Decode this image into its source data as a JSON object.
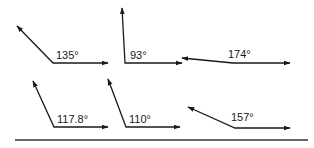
{
  "diagram": {
    "type": "angle-set",
    "colors": {
      "stroke": "#1a1a1a",
      "baseline": "#333333",
      "background": "#ffffff"
    },
    "angles": [
      {
        "label": "135°",
        "vertex": [
          53,
          63
        ],
        "ray1_end": [
          108,
          63
        ],
        "ray2_end": [
          17,
          26
        ],
        "label_pos": [
          56,
          59
        ]
      },
      {
        "label": "93°",
        "vertex": [
          125,
          63
        ],
        "ray1_end": [
          182,
          63
        ],
        "ray2_end": [
          122,
          8
        ],
        "label_pos": [
          130,
          59
        ]
      },
      {
        "label": "174°",
        "vertex": [
          233,
          63
        ],
        "ray1_end": [
          290,
          63
        ],
        "ray2_end": [
          182,
          58
        ],
        "label_pos": [
          228,
          58
        ]
      },
      {
        "label": "117.8°",
        "vertex": [
          54,
          127
        ],
        "ray1_end": [
          108,
          127
        ],
        "ray2_end": [
          33,
          81
        ],
        "label_pos": [
          57,
          123
        ]
      },
      {
        "label": "110°",
        "vertex": [
          126,
          127
        ],
        "ray1_end": [
          180,
          127
        ],
        "ray2_end": [
          108,
          79
        ],
        "label_pos": [
          129,
          123
        ]
      },
      {
        "label": "157°",
        "vertex": [
          235,
          128
        ],
        "ray1_end": [
          290,
          128
        ],
        "ray2_end": [
          188,
          107
        ],
        "label_pos": [
          231,
          121
        ]
      }
    ],
    "baseline": {
      "from": [
        15,
        140
      ],
      "to": [
        308,
        140
      ]
    }
  }
}
